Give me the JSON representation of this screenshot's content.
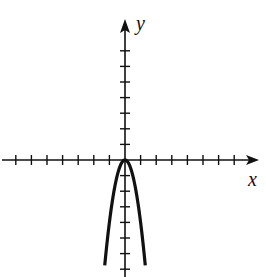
{
  "chart_data": {
    "type": "line",
    "title": "",
    "xlabel": "x",
    "ylabel": "y",
    "xlim": [
      -8,
      8.5
    ],
    "ylim": [
      -7.2,
      9
    ],
    "grid": false,
    "legend": null,
    "x_ticks_per_side": 7,
    "y_ticks_per_side": 7,
    "tick_labels": false,
    "series": [
      {
        "name": "y = -4x^2",
        "description": "Downward-opening parabola with vertex at origin",
        "x": [
          -1.3,
          -1.2,
          -1.0,
          -0.8,
          -0.6,
          -0.4,
          -0.2,
          0,
          0.2,
          0.4,
          0.6,
          0.8,
          1.0,
          1.2,
          1.3
        ],
        "y": [
          -6.76,
          -5.76,
          -4.0,
          -2.56,
          -1.44,
          -0.64,
          -0.16,
          0,
          -0.16,
          -0.64,
          -1.44,
          -2.56,
          -4.0,
          -5.76,
          -6.76
        ]
      }
    ]
  },
  "axes": {
    "x_label": "x",
    "y_label": "y"
  },
  "colors": {
    "axis": "#111111",
    "curve": "#111111",
    "background": "#ffffff"
  }
}
